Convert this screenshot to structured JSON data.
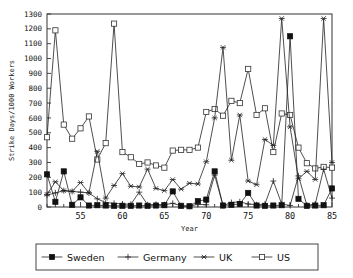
{
  "chart_data": {
    "type": "line",
    "title": "",
    "xlabel": "Year",
    "ylabel": "Strike Days/1000 Workers",
    "xlim": [
      51,
      85
    ],
    "ylim": [
      0,
      1300
    ],
    "ytick_step": 100,
    "yticks": [
      0,
      100,
      200,
      300,
      400,
      500,
      600,
      700,
      800,
      900,
      1000,
      1100,
      1200,
      1300
    ],
    "xticks": [
      55,
      60,
      65,
      70,
      75,
      80,
      85
    ],
    "xticks_minor_step": 1,
    "grid": false,
    "legend_position": "bottom",
    "x": [
      51,
      52,
      53,
      54,
      55,
      56,
      57,
      58,
      59,
      60,
      61,
      62,
      63,
      64,
      65,
      66,
      67,
      68,
      69,
      70,
      71,
      72,
      73,
      74,
      75,
      76,
      77,
      78,
      79,
      80,
      81,
      82,
      83,
      84,
      85
    ],
    "series": [
      {
        "name": "Sweden",
        "marker": "filled-square",
        "values": [
          220,
          35,
          240,
          15,
          65,
          10,
          12,
          10,
          8,
          8,
          8,
          10,
          8,
          10,
          12,
          105,
          8,
          5,
          40,
          50,
          240,
          10,
          15,
          20,
          95,
          10,
          8,
          10,
          12,
          1150,
          55,
          8,
          10,
          12,
          125
        ]
      },
      {
        "name": "Germany",
        "marker": "plus",
        "values": [
          80,
          95,
          110,
          105,
          100,
          95,
          55,
          30,
          25,
          20,
          18,
          100,
          15,
          18,
          15,
          25,
          8,
          5,
          18,
          15,
          215,
          10,
          30,
          35,
          20,
          15,
          20,
          175,
          20,
          10,
          210,
          12,
          20,
          255,
          60
        ]
      },
      {
        "name": "UK",
        "marker": "asterisk",
        "values": [
          85,
          170,
          110,
          105,
          165,
          95,
          375,
          60,
          145,
          225,
          140,
          135,
          255,
          125,
          110,
          185,
          120,
          160,
          155,
          305,
          600,
          1075,
          315,
          620,
          175,
          150,
          455,
          415,
          1270,
          540,
          190,
          240,
          185,
          1270,
          300
        ]
      },
      {
        "name": "US",
        "marker": "open-square",
        "values": [
          470,
          1190,
          555,
          460,
          530,
          610,
          320,
          430,
          1235,
          370,
          335,
          290,
          300,
          280,
          265,
          380,
          385,
          385,
          400,
          640,
          660,
          615,
          715,
          700,
          930,
          620,
          665,
          370,
          630,
          620,
          400,
          295,
          260,
          270,
          265
        ]
      }
    ],
    "series_us_tail": [
      230,
      230,
      215,
      195,
      110,
      185,
      95,
      85
    ],
    "notes": ""
  },
  "legend": {
    "entries": [
      {
        "label": "Sweden",
        "marker": "filled-square"
      },
      {
        "label": "Germany",
        "marker": "plus"
      },
      {
        "label": "UK",
        "marker": "asterisk"
      },
      {
        "label": "US",
        "marker": "open-square"
      }
    ]
  },
  "colors": {
    "background": "#ffffff",
    "line": "#222222",
    "frame": "#333333",
    "text": "#111111"
  }
}
